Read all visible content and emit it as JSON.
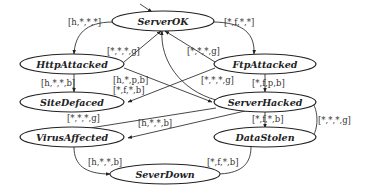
{
  "diagram": {
    "type": "state-transition",
    "states": [
      {
        "id": "ServerOK",
        "label": "ServerOK",
        "initial": true
      },
      {
        "id": "HttpAttacked",
        "label": "HttpAttacked"
      },
      {
        "id": "FtpAttacked",
        "label": "FtpAttacked"
      },
      {
        "id": "SiteDefaced",
        "label": "SiteDefaced"
      },
      {
        "id": "ServerHacked",
        "label": "ServerHacked"
      },
      {
        "id": "VirusAffected",
        "label": "VirusAffected"
      },
      {
        "id": "DataStolen",
        "label": "DataStolen"
      },
      {
        "id": "SeverDown",
        "label": "SeverDown"
      }
    ],
    "transitions": [
      {
        "from": "ServerOK",
        "to": "HttpAttacked",
        "label": "[h,*,*,*]"
      },
      {
        "from": "ServerOK",
        "to": "FtpAttacked",
        "label": "[*,f,*,*]"
      },
      {
        "from": "HttpAttacked",
        "to": "ServerOK",
        "label": "[*,*,*,g]"
      },
      {
        "from": "FtpAttacked",
        "to": "ServerOK",
        "label": "[*,*,*,g]"
      },
      {
        "from": "ServerHacked",
        "to": "ServerOK",
        "label": "[*,*,*,g]"
      },
      {
        "from": "HttpAttacked",
        "to": "SiteDefaced",
        "label": "[h,*,*,b]"
      },
      {
        "from": "HttpAttacked",
        "to": "ServerHacked",
        "label": "[h,*,p,b]"
      },
      {
        "from": "FtpAttacked",
        "to": "SiteDefaced",
        "label": "[*,f,*,b]"
      },
      {
        "from": "FtpAttacked",
        "to": "ServerHacked",
        "label": "[*,f,p,b]"
      },
      {
        "from": "VirusAffected",
        "to": "ServerOK",
        "label": "[*,*,*,g]"
      },
      {
        "from": "ServerHacked",
        "to": "VirusAffected",
        "label": "[h,*,*,b]"
      },
      {
        "from": "ServerHacked",
        "to": "DataStolen",
        "label": "[*,f,*,b]"
      },
      {
        "from": "DataStolen",
        "to": "ServerHacked",
        "label": "[*,*,*,g]"
      },
      {
        "from": "VirusAffected",
        "to": "SeverDown",
        "label": "[h,*,*,b]"
      },
      {
        "from": "DataStolen",
        "to": "SeverDown",
        "label": "[*,f,*,b]"
      }
    ]
  }
}
